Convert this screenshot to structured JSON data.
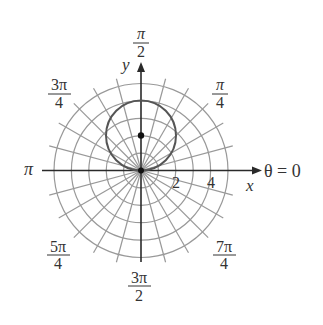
{
  "chart_data": {
    "type": "polar",
    "title": "",
    "curve": {
      "equation": "r = 4 sin(theta)",
      "description": "circle of diameter 4 passing through the pole, centered at (0, 2)",
      "center_xy": [
        0,
        2
      ],
      "radius": 2,
      "color": "#555555"
    },
    "points": [
      {
        "label": "center",
        "x": 0,
        "y": 2
      },
      {
        "label": "pole",
        "x": 0,
        "y": 0
      }
    ],
    "grid": {
      "radial_circles": [
        1,
        2,
        3,
        4,
        5
      ],
      "angular_step_deg": 15,
      "color": "#999999"
    },
    "axes": {
      "xlabel": "x",
      "ylabel": "y",
      "polar_axis_label": "θ = 0",
      "radial_tick_labels": [
        "2",
        "4"
      ]
    },
    "angle_labels": [
      {
        "angle": "0",
        "text": "θ = 0"
      },
      {
        "angle": "π/4",
        "num": "π",
        "den": "4"
      },
      {
        "angle": "π/2",
        "num": "π",
        "den": "2"
      },
      {
        "angle": "3π/4",
        "num": "3π",
        "den": "4"
      },
      {
        "angle": "π",
        "text": "π"
      },
      {
        "angle": "5π/4",
        "num": "5π",
        "den": "4"
      },
      {
        "angle": "3π/2",
        "num": "3π",
        "den": "2"
      },
      {
        "angle": "7π/4",
        "num": "7π",
        "den": "4"
      }
    ],
    "rlim": [
      0,
      5
    ]
  },
  "labels": {
    "x_axis": "x",
    "y_axis": "y",
    "theta_zero": "θ = 0",
    "pi": "π",
    "tick_2": "2",
    "tick_4": "4",
    "pi_over_2": {
      "num": "π",
      "den": "2"
    },
    "pi_over_4": {
      "num": "π",
      "den": "4"
    },
    "three_pi_over_4": {
      "num": "3π",
      "den": "4"
    },
    "five_pi_over_4": {
      "num": "5π",
      "den": "4"
    },
    "three_pi_over_2": {
      "num": "3π",
      "den": "2"
    },
    "seven_pi_over_4": {
      "num": "7π",
      "den": "4"
    }
  }
}
